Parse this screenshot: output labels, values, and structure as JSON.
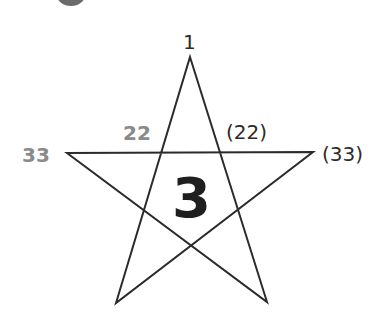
{
  "header": {
    "partial_text": "· · · · ·  ·  ·",
    "circle_color": "#6b6b6b"
  },
  "diagram": {
    "shape": "pentagram",
    "stroke_color": "#2b2b2b",
    "vertices": {
      "top": [
        190,
        57
      ],
      "left": [
        67,
        153
      ],
      "right": [
        313,
        152
      ],
      "bottom_left": [
        116,
        303
      ],
      "bottom_right": [
        267,
        302
      ]
    },
    "labels": {
      "top_vertex": "1",
      "left_vertex": "33",
      "left_intersection": "22",
      "right_intersection": "(22)",
      "right_vertex": "(33)",
      "center": "3"
    },
    "colors": {
      "gray_label": "#8a8a8a",
      "dark_label": "#2b2b2b",
      "center_label": "#1f1f1f"
    }
  }
}
